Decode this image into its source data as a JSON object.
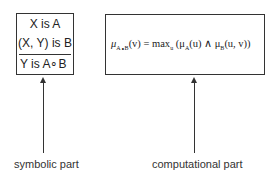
{
  "symbolic": {
    "lines": [
      "X is A",
      "(X, Y) is B",
      "Y is A∘B"
    ],
    "label": "symbolic part"
  },
  "computational": {
    "formula": "μA∘B(v) = max u (μA(u) ∧ μB(u, v))",
    "formula_parts": {
      "lhs_mu": "μ",
      "lhs_sub": "A∘B",
      "lhs_arg": "(v) = max",
      "max_sub": "u",
      "rhs_open": " (μ",
      "a_sub": "A",
      "a_arg": "(u) ∧ μ",
      "b_sub": "B",
      "b_arg": "(u, v))"
    },
    "label": "computational part"
  }
}
